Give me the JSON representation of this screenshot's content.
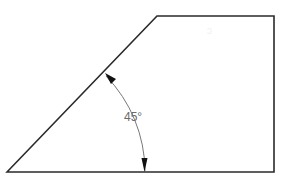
{
  "diagram": {
    "type": "trapezoid-with-angle-dimension",
    "shape": {
      "vertices": [
        [
          7,
          172
        ],
        [
          157,
          16
        ],
        [
          274,
          16
        ],
        [
          274,
          172
        ]
      ],
      "stroke": "#2a2a2a",
      "stroke_width": 1.6
    },
    "angle_dimension": {
      "label": "45°",
      "value_degrees": 45,
      "label_color": "#6b6b6b",
      "arc_color": "#555555",
      "arrow_color": "#111111"
    },
    "faint_mark": "ↄ"
  }
}
